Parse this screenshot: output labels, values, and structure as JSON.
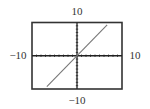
{
  "chart_data": {
    "type": "line",
    "title": "",
    "xlabel": "",
    "ylabel": "",
    "xlim": [
      -10,
      10
    ],
    "ylim": [
      -10,
      10
    ],
    "xscl": 1,
    "yscl": 1,
    "grid": false,
    "window_labels": {
      "xmin": "−10",
      "xmax": "10",
      "ymin": "−10",
      "ymax": "10"
    },
    "series": [
      {
        "name": "line",
        "x": [
          -6.7,
          6.7
        ],
        "y": [
          -9.3,
          9.3
        ]
      }
    ],
    "colors": {
      "frame": "#333333",
      "axes": "#222222",
      "line": "#777777"
    }
  }
}
